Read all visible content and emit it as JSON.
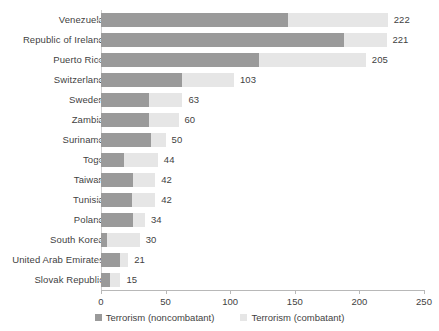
{
  "chart_data": {
    "type": "bar",
    "orientation": "horizontal",
    "stacked": true,
    "title": "",
    "subtitle": "",
    "xlabel": "",
    "ylabel": "",
    "xlim": [
      0,
      250
    ],
    "xticks": [
      0,
      50,
      100,
      150,
      200,
      250
    ],
    "xtick_labels": [
      "0",
      "50",
      "100",
      "150",
      "200",
      "250"
    ],
    "grid": false,
    "legend_position": "bottom",
    "categories": [
      "Venezuela",
      "Republic of Ireland",
      "Puerto Rico",
      "Switzerland",
      "Sweden",
      "Zambia",
      "Suriname",
      "Togo",
      "Taiwan",
      "Tunisia",
      "Poland",
      "South Korea",
      "United Arab Emirates",
      "Slovak Republic"
    ],
    "series": [
      {
        "name": "Terrorism (noncombatant)",
        "color": "#9a9a9a",
        "values": [
          145,
          188,
          122,
          63,
          37,
          37,
          39,
          18,
          25,
          24,
          25,
          5,
          15,
          7
        ]
      },
      {
        "name": "Terrorism (combatant)",
        "color": "#e6e6e6",
        "values": [
          77,
          33,
          83,
          40,
          26,
          23,
          11,
          26,
          17,
          18,
          9,
          25,
          6,
          8
        ]
      }
    ],
    "totals": [
      222,
      221,
      205,
      103,
      63,
      60,
      50,
      44,
      42,
      42,
      34,
      30,
      21,
      15
    ],
    "total_labels": [
      "222",
      "221",
      "205",
      "103",
      "63",
      "60",
      "50",
      "44",
      "42",
      "42",
      "34",
      "30",
      "21",
      "15"
    ]
  },
  "legend": {
    "items": [
      {
        "label": "Terrorism (noncombatant)",
        "color": "#9a9a9a"
      },
      {
        "label": "Terrorism (combatant)",
        "color": "#e6e6e6"
      }
    ]
  }
}
